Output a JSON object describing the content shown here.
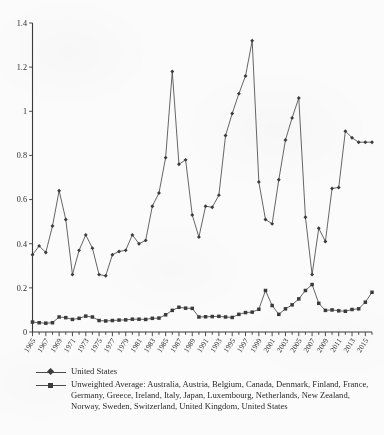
{
  "chart_data": {
    "type": "line",
    "title": "",
    "subtitle": "",
    "xlabel": "",
    "ylabel": "",
    "xlim": [
      1965,
      2016
    ],
    "ylim": [
      0,
      1.4
    ],
    "yticks": [
      "0",
      "0.2",
      "0.4",
      "0.6",
      "0.8",
      "1",
      "1.2",
      "1.4"
    ],
    "ytick_values": [
      0,
      0.2,
      0.4,
      0.6,
      0.8,
      1.0,
      1.2,
      1.4
    ],
    "grid": false,
    "legend_position": "below-axes",
    "x": [
      1965,
      1966,
      1967,
      1968,
      1969,
      1970,
      1971,
      1972,
      1973,
      1974,
      1975,
      1976,
      1977,
      1978,
      1979,
      1980,
      1981,
      1982,
      1983,
      1984,
      1985,
      1986,
      1987,
      1988,
      1989,
      1990,
      1991,
      1992,
      1993,
      1994,
      1995,
      1996,
      1997,
      1998,
      1999,
      2000,
      2001,
      2002,
      2003,
      2004,
      2005,
      2006,
      2007,
      2008,
      2009,
      2010,
      2011,
      2012,
      2013,
      2014,
      2015,
      2016
    ],
    "xtick_labels": [
      "1965",
      "1967",
      "1969",
      "1971",
      "1973",
      "1975",
      "1977",
      "1979",
      "1981",
      "1983",
      "1985",
      "1987",
      "1989",
      "1991",
      "1993",
      "1995",
      "1997",
      "1999",
      "2001",
      "2003",
      "2005",
      "2007",
      "2009",
      "2011",
      "2013",
      "2015"
    ],
    "xtick_values": [
      1965,
      1967,
      1969,
      1971,
      1973,
      1975,
      1977,
      1979,
      1981,
      1983,
      1985,
      1987,
      1989,
      1991,
      1993,
      1995,
      1997,
      1999,
      2001,
      2003,
      2005,
      2007,
      2009,
      2011,
      2013,
      2015
    ],
    "series": [
      {
        "name": "United States",
        "marker": "diamond",
        "color": "#3b3b3b",
        "values": [
          0.35,
          0.39,
          0.36,
          0.48,
          0.64,
          0.51,
          0.26,
          0.37,
          0.44,
          0.38,
          0.26,
          0.255,
          0.35,
          0.365,
          0.37,
          0.44,
          0.4,
          0.415,
          0.57,
          0.63,
          0.79,
          1.18,
          0.76,
          0.78,
          0.53,
          0.43,
          0.57,
          0.565,
          0.62,
          0.89,
          0.99,
          1.08,
          1.16,
          1.32,
          0.68,
          0.51,
          0.49,
          0.69,
          0.87,
          0.97,
          1.06,
          0.52,
          0.26,
          0.47,
          0.41,
          0.65,
          0.655,
          0.91,
          0.88,
          0.86,
          0.86,
          0.86
        ]
      },
      {
        "name": "Unweighted Average: Australia, Austria, Belgium, Canada, Denmark, Finland, France, Germany, Greece, Ireland, Italy, Japan, Luxembourg, Netherlands, New Zealand, Norway, Sweden, Switzerland, United Kingdom, United States",
        "marker": "square",
        "color": "#3b3b3b",
        "values": [
          0.045,
          0.042,
          0.04,
          0.042,
          0.068,
          0.065,
          0.057,
          0.062,
          0.072,
          0.068,
          0.052,
          0.05,
          0.052,
          0.054,
          0.055,
          0.058,
          0.058,
          0.057,
          0.062,
          0.063,
          0.078,
          0.098,
          0.112,
          0.108,
          0.107,
          0.068,
          0.069,
          0.07,
          0.071,
          0.068,
          0.066,
          0.08,
          0.088,
          0.09,
          0.103,
          0.188,
          0.12,
          0.08,
          0.105,
          0.123,
          0.15,
          0.188,
          0.215,
          0.13,
          0.098,
          0.1,
          0.096,
          0.094,
          0.102,
          0.105,
          0.135,
          0.18
        ]
      }
    ]
  },
  "legend": {
    "items": [
      {
        "label": "United States",
        "marker": "diamond"
      },
      {
        "label": "Unweighted Average: Australia, Austria, Belgium, Canada, Denmark, Finland, France, Germany, Greece, Ireland, Italy, Japan, Luxembourg, Netherlands, New Zealand, Norway, Sweden, Switzerland, United Kingdom, United States",
        "marker": "square"
      }
    ]
  }
}
